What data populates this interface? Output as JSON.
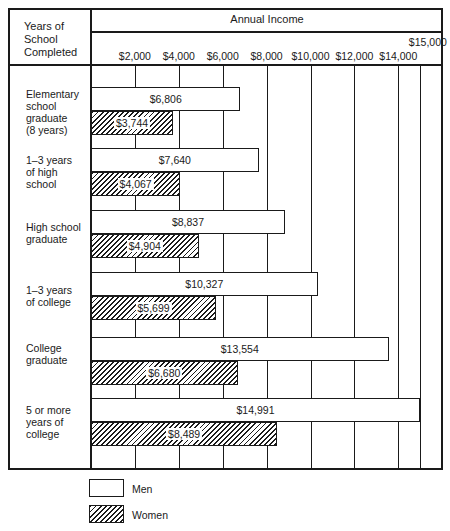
{
  "chart_data": {
    "type": "bar",
    "orientation": "horizontal",
    "title": "Annual Income",
    "row_header": "Years of School Completed",
    "xlabel": "Annual Income",
    "ylabel": "Years of School Completed",
    "xlim": [
      0,
      15000
    ],
    "x_ticks": [
      "$2,000",
      "$4,000",
      "$6,000",
      "$8,000",
      "$10,000",
      "$12,000",
      "$14,000",
      "$15,000"
    ],
    "grid": true,
    "categories": [
      "Elementary school graduate (8 years)",
      "1–3 years of high school",
      "High school graduate",
      "1–3 years of college",
      "College graduate",
      "5 or more years of college"
    ],
    "series": [
      {
        "name": "Men",
        "values": [
          6806,
          7640,
          8837,
          10327,
          13554,
          14991
        ]
      },
      {
        "name": "Women",
        "values": [
          3744,
          4067,
          4904,
          5699,
          6680,
          8489
        ]
      }
    ],
    "legend": {
      "position": "bottom-left",
      "entries": [
        "Men",
        "Women"
      ]
    }
  },
  "header": {
    "corner_lines": [
      "Years of",
      "School",
      "Completed"
    ],
    "title": "Annual Income"
  },
  "ticks": [
    {
      "label": "$2,000",
      "value": 2000
    },
    {
      "label": "$4,000",
      "value": 4000
    },
    {
      "label": "$6,000",
      "value": 6000
    },
    {
      "label": "$8,000",
      "value": 8000
    },
    {
      "label": "$10,000",
      "value": 10000
    },
    {
      "label": "$12,000",
      "value": 12000
    },
    {
      "label": "$14,000",
      "value": 14000
    },
    {
      "label": "$15,000",
      "value": 15000
    }
  ],
  "rows": [
    {
      "lines": [
        "Elementary",
        "school",
        "graduate",
        "(8 years)"
      ],
      "men": 6806,
      "men_label": "$6,806",
      "women": 3744,
      "women_label": "$3,744"
    },
    {
      "lines": [
        "1–3 years",
        "of high",
        "school"
      ],
      "men": 7640,
      "men_label": "$7,640",
      "women": 4067,
      "women_label": "$4,067"
    },
    {
      "lines": [
        "High school",
        "graduate"
      ],
      "men": 8837,
      "men_label": "$8,837",
      "women": 4904,
      "women_label": "$4,904"
    },
    {
      "lines": [
        "1–3 years",
        "of college"
      ],
      "men": 10327,
      "men_label": "$10,327",
      "women": 5699,
      "women_label": "$5,699"
    },
    {
      "lines": [
        "College",
        "graduate"
      ],
      "men": 13554,
      "men_label": "$13,554",
      "women": 6680,
      "women_label": "$6,680"
    },
    {
      "lines": [
        "5 or more",
        "years of",
        "college"
      ],
      "men": 14991,
      "men_label": "$14,991",
      "women": 8489,
      "women_label": "$8,489"
    }
  ],
  "legend": {
    "men_label": "Men",
    "women_label": "Women"
  }
}
